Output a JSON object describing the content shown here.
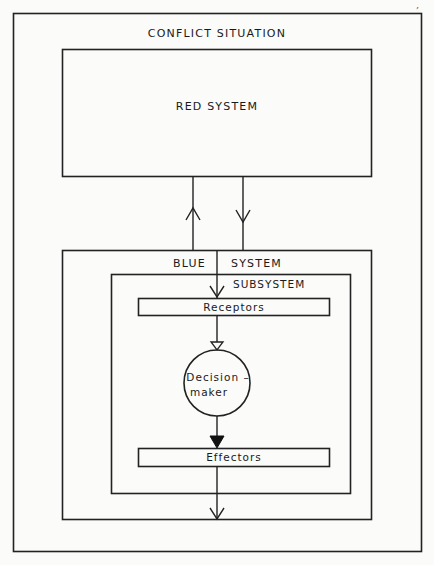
{
  "diagram": {
    "title": "CONFLICT SITUATION",
    "page_mark": ",",
    "red_system": {
      "label": "RED SYSTEM"
    },
    "blue_system": {
      "label_left": "BLUE",
      "label_right": "SYSTEM"
    },
    "subsystem": {
      "label": "SUBSYSTEM",
      "receptors": "Receptors",
      "decision_maker_line1": "Decision –",
      "decision_maker_line2": "maker",
      "effectors": "Effectors"
    },
    "connections": [
      {
        "from": "Blue System",
        "to": "Red System",
        "direction": "up"
      },
      {
        "from": "Red System",
        "to": "Receptors",
        "direction": "down"
      },
      {
        "from": "Receptors",
        "to": "Decision-maker",
        "arrow": "open-triangle"
      },
      {
        "from": "Decision-maker",
        "to": "Effectors",
        "arrow": "filled-triangle"
      },
      {
        "from": "Effectors",
        "to": "Conflict Situation",
        "direction": "down"
      }
    ]
  }
}
